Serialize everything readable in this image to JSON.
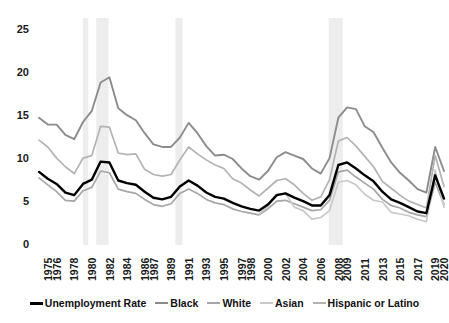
{
  "chart_data": {
    "type": "line",
    "title": "",
    "xlabel": "",
    "ylabel": "",
    "ylim": [
      0,
      25
    ],
    "yticks": [
      0,
      5,
      10,
      15,
      20,
      25
    ],
    "grid": false,
    "legend_position": "bottom",
    "x_start": 1975,
    "x_end": 2021,
    "xtick_labels": [
      "1975",
      "1976",
      "1978",
      "1980",
      "1982",
      "1984",
      "1986",
      "1987",
      "1989",
      "1991",
      "1993",
      "1995",
      "1997",
      "1998",
      "2000",
      "2002",
      "2004",
      "2006",
      "2008",
      "2009",
      "2011",
      "2013",
      "2015",
      "2017",
      "2019",
      "2020"
    ],
    "xtick_years": [
      1975,
      1976,
      1978,
      1980,
      1982,
      1984,
      1986,
      1987,
      1989,
      1991,
      1993,
      1995,
      1997,
      1998,
      2000,
      2002,
      2004,
      2006,
      2008,
      2009,
      2011,
      2013,
      2015,
      2017,
      2019,
      2020
    ],
    "x": [
      1975,
      1976,
      1977,
      1978,
      1979,
      1980,
      1981,
      1982,
      1983,
      1984,
      1985,
      1986,
      1987,
      1988,
      1989,
      1990,
      1991,
      1992,
      1993,
      1994,
      1995,
      1996,
      1997,
      1998,
      1999,
      2000,
      2001,
      2002,
      2003,
      2004,
      2005,
      2006,
      2007,
      2008,
      2009,
      2010,
      2011,
      2012,
      2013,
      2014,
      2015,
      2016,
      2017,
      2018,
      2019,
      2020,
      2021
    ],
    "recession_bands": [
      {
        "start": 1980.0,
        "end": 1980.6
      },
      {
        "start": 1981.5,
        "end": 1982.9
      },
      {
        "start": 1990.5,
        "end": 1991.3
      },
      {
        "start": 2007.9,
        "end": 2009.5
      }
    ],
    "series": [
      {
        "name": "Unemployment Rate",
        "color": "#000000",
        "width": 2.4,
        "values": [
          8.5,
          7.7,
          7.1,
          6.1,
          5.8,
          7.1,
          7.6,
          9.7,
          9.6,
          7.5,
          7.2,
          7.0,
          6.2,
          5.5,
          5.3,
          5.6,
          6.8,
          7.5,
          6.9,
          6.1,
          5.6,
          5.4,
          4.9,
          4.5,
          4.2,
          4.0,
          4.7,
          5.8,
          6.0,
          5.5,
          5.1,
          4.6,
          4.6,
          5.8,
          9.3,
          9.6,
          8.9,
          8.1,
          7.4,
          6.2,
          5.3,
          4.9,
          4.4,
          3.9,
          3.7,
          8.1,
          5.4
        ]
      },
      {
        "name": "Black",
        "color": "#8c8c8c",
        "width": 1.9,
        "values": [
          14.8,
          14.0,
          14.0,
          12.8,
          12.3,
          14.3,
          15.6,
          18.9,
          19.5,
          15.9,
          15.1,
          14.5,
          13.0,
          11.7,
          11.4,
          11.4,
          12.5,
          14.2,
          13.0,
          11.5,
          10.4,
          10.5,
          10.0,
          8.9,
          8.0,
          7.6,
          8.6,
          10.2,
          10.8,
          10.4,
          10.0,
          8.9,
          8.3,
          10.1,
          14.8,
          16.0,
          15.8,
          13.8,
          13.1,
          11.3,
          9.6,
          8.4,
          7.5,
          6.5,
          6.1,
          11.4,
          8.6
        ]
      },
      {
        "name": "White",
        "color": "#a6a6a6",
        "width": 1.7,
        "values": [
          7.8,
          7.0,
          6.2,
          5.2,
          5.1,
          6.3,
          6.7,
          8.6,
          8.4,
          6.5,
          6.2,
          6.0,
          5.3,
          4.7,
          4.5,
          4.8,
          6.0,
          6.5,
          6.0,
          5.3,
          4.9,
          4.7,
          4.2,
          3.9,
          3.7,
          3.5,
          4.2,
          5.1,
          5.2,
          4.8,
          4.4,
          4.0,
          4.1,
          5.2,
          8.5,
          8.7,
          7.9,
          7.2,
          6.5,
          5.3,
          4.6,
          4.3,
          3.8,
          3.5,
          3.3,
          7.3,
          4.7
        ]
      },
      {
        "name": "Asian",
        "color": "#c9c9c9",
        "width": 1.7,
        "values": [
          null,
          null,
          null,
          null,
          null,
          null,
          null,
          null,
          null,
          null,
          null,
          null,
          null,
          null,
          null,
          null,
          null,
          null,
          null,
          null,
          null,
          null,
          null,
          null,
          null,
          3.6,
          4.5,
          5.9,
          6.0,
          4.4,
          4.0,
          3.0,
          3.2,
          4.0,
          7.3,
          7.5,
          7.0,
          5.9,
          5.2,
          5.0,
          3.8,
          3.6,
          3.4,
          3.0,
          2.7,
          8.7,
          4.4
        ]
      },
      {
        "name": "Hispanic or Latino",
        "color": "#b3b3b3",
        "width": 1.7,
        "values": [
          12.2,
          11.4,
          10.1,
          9.1,
          8.3,
          10.1,
          10.4,
          13.8,
          13.7,
          10.7,
          10.5,
          10.6,
          8.8,
          8.2,
          8.0,
          8.2,
          9.9,
          11.4,
          10.6,
          9.9,
          9.3,
          8.9,
          7.7,
          7.2,
          6.4,
          5.7,
          6.6,
          7.5,
          7.7,
          7.0,
          6.0,
          5.2,
          5.6,
          7.6,
          12.1,
          12.5,
          11.5,
          10.3,
          9.1,
          7.4,
          6.6,
          5.8,
          5.1,
          4.7,
          4.3,
          10.4,
          6.8
        ]
      }
    ]
  },
  "legend": {
    "items": [
      {
        "label": "Unemployment Rate",
        "color": "#000000",
        "width": 3
      },
      {
        "label": "Black",
        "color": "#8c8c8c",
        "width": 2.5
      },
      {
        "label": "White",
        "color": "#a6a6a6",
        "width": 2.5
      },
      {
        "label": "Asian",
        "color": "#c9c9c9",
        "width": 2.5
      },
      {
        "label": "Hispanic or Latino",
        "color": "#b3b3b3",
        "width": 2.5
      }
    ]
  },
  "style": {
    "background": "#ffffff",
    "recession_band_color": "#ededed",
    "axis_text_color": "#1a1a1a"
  }
}
